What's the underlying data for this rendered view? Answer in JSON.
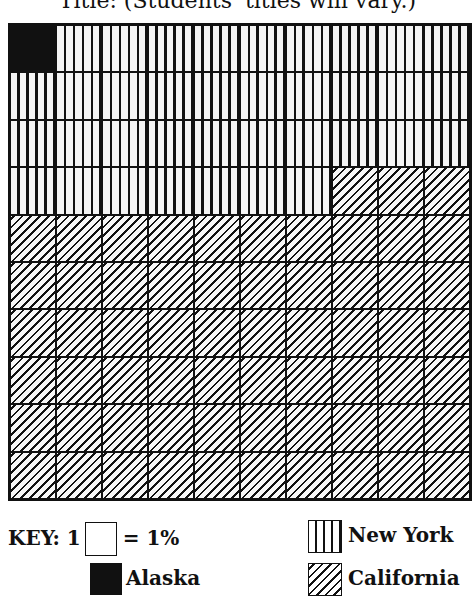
{
  "title": "Title: (Students' titles will vary.)",
  "key": {
    "label": "KEY: 1",
    "unit_text": "= 1%",
    "legend": [
      {
        "name": "Alaska",
        "pattern": "solid-black"
      },
      {
        "name": "New York",
        "pattern": "vertical-lines"
      },
      {
        "name": "California",
        "pattern": "diagonal-lines"
      }
    ]
  },
  "chart_data": {
    "type": "waffle",
    "title": "Title: (Students' titles will vary.)",
    "grid": {
      "rows": 10,
      "cols": 10,
      "cell_value_percent": 1
    },
    "fill_order": "row-major, top-left first",
    "categories": [
      "Alaska",
      "New York",
      "California"
    ],
    "values": [
      1,
      36,
      63
    ],
    "units": "%",
    "legend_position": "bottom",
    "rows_detail": [
      [
        "Alaska",
        "New York",
        "New York",
        "New York",
        "New York",
        "New York",
        "New York",
        "New York",
        "New York",
        "New York"
      ],
      [
        "New York",
        "New York",
        "New York",
        "New York",
        "New York",
        "New York",
        "New York",
        "New York",
        "New York",
        "New York"
      ],
      [
        "New York",
        "New York",
        "New York",
        "New York",
        "New York",
        "New York",
        "New York",
        "New York",
        "New York",
        "New York"
      ],
      [
        "New York",
        "New York",
        "New York",
        "New York",
        "New York",
        "New York",
        "New York",
        "California",
        "California",
        "California"
      ],
      [
        "California",
        "California",
        "California",
        "California",
        "California",
        "California",
        "California",
        "California",
        "California",
        "California"
      ],
      [
        "California",
        "California",
        "California",
        "California",
        "California",
        "California",
        "California",
        "California",
        "California",
        "California"
      ],
      [
        "California",
        "California",
        "California",
        "California",
        "California",
        "California",
        "California",
        "California",
        "California",
        "California"
      ],
      [
        "California",
        "California",
        "California",
        "California",
        "California",
        "California",
        "California",
        "California",
        "California",
        "California"
      ],
      [
        "California",
        "California",
        "California",
        "California",
        "California",
        "California",
        "California",
        "California",
        "California",
        "California"
      ],
      [
        "California",
        "California",
        "California",
        "California",
        "California",
        "California",
        "California",
        "California",
        "California",
        "California"
      ]
    ]
  }
}
